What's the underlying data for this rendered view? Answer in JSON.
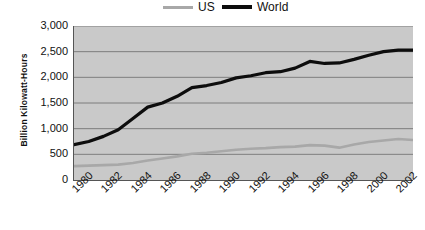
{
  "legend": {
    "position": "top-center",
    "entries": [
      {
        "name": "US",
        "color": "#a8a8a8"
      },
      {
        "name": "World",
        "color": "#0d0d0d"
      }
    ]
  },
  "axes": {
    "ylabel": "Billion Kilowatt-Hours",
    "xlabel": "",
    "yticks": [
      "0",
      "500",
      "1,000",
      "1,500",
      "2,000",
      "2,500",
      "3,000"
    ],
    "xticks": [
      "1980",
      "1982",
      "1984",
      "1986",
      "1988",
      "1990",
      "1992",
      "1994",
      "1996",
      "1998",
      "2000",
      "2002"
    ]
  },
  "colors": {
    "plot_background": "#c9c9c9",
    "gridline": "#6b6b6b",
    "axis": "#555555",
    "us_line": "#a8a8a8",
    "world_line": "#0d0d0d",
    "page_background": "#ffffff",
    "text": "#111111"
  },
  "chart_data": {
    "type": "line",
    "title": "",
    "xlabel": "",
    "ylabel": "Billion Kilowatt-Hours",
    "xlim": [
      1980,
      2003
    ],
    "ylim": [
      0,
      3000
    ],
    "ytick_values": [
      0,
      500,
      1000,
      1500,
      2000,
      2500,
      3000
    ],
    "xtick_values": [
      1980,
      1982,
      1984,
      1986,
      1988,
      1990,
      1992,
      1994,
      1996,
      1998,
      2000,
      2002
    ],
    "grid": "horizontal",
    "legend_position": "top-center",
    "x": [
      1980,
      1981,
      1982,
      1983,
      1984,
      1985,
      1986,
      1987,
      1988,
      1989,
      1990,
      1991,
      1992,
      1993,
      1994,
      1995,
      1996,
      1997,
      1998,
      1999,
      2000,
      2001,
      2002,
      2003
    ],
    "series": [
      {
        "name": "US",
        "color": "#a8a8a8",
        "values": [
          270,
          280,
          290,
          300,
          330,
          380,
          420,
          460,
          510,
          530,
          560,
          590,
          610,
          620,
          640,
          650,
          680,
          670,
          630,
          690,
          740,
          770,
          800,
          780
        ]
      },
      {
        "name": "World",
        "color": "#0d0d0d",
        "values": [
          690,
          750,
          850,
          980,
          1200,
          1420,
          1500,
          1630,
          1800,
          1840,
          1900,
          1990,
          2030,
          2090,
          2110,
          2180,
          2310,
          2270,
          2280,
          2350,
          2430,
          2500,
          2530,
          2530
        ]
      }
    ]
  }
}
